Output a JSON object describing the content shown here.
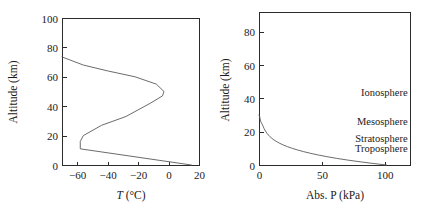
{
  "figure": {
    "background_color": "#ffffff",
    "axis_color": "#2b2b2b",
    "curve_color": "#5a5a5a",
    "text_color": "#1a1a1a"
  },
  "chart_data": [
    {
      "type": "line",
      "id": "temperature-profile",
      "title": "",
      "xlabel_prefix": "T",
      "xlabel_suffix": " (°C)",
      "xlabel": "T (°C)",
      "ylabel": "Altitude (km)",
      "xlim": [
        -70,
        20
      ],
      "ylim": [
        0,
        100
      ],
      "grid": false,
      "legend": "none",
      "xticks": [
        -60,
        -40,
        -20,
        0,
        20
      ],
      "xtick_labels": [
        "−60",
        "−40",
        "−20",
        "0",
        "20"
      ],
      "yticks": [
        0,
        20,
        40,
        60,
        80,
        100
      ],
      "ytick_labels": [
        "0",
        "20",
        "40",
        "60",
        "80",
        "100"
      ],
      "series": [
        {
          "name": "Standard atmosphere temperature",
          "x": [
            15,
            -58,
            -58,
            -56,
            -44,
            -28,
            -12,
            -4,
            -3,
            -8,
            -22,
            -40,
            -56,
            -70
          ],
          "y": [
            0,
            11,
            16,
            20,
            27,
            33,
            42,
            47,
            50,
            55,
            60,
            64,
            68,
            73.5
          ],
          "x_units": "°C",
          "y_units": "km"
        }
      ]
    },
    {
      "type": "line",
      "id": "pressure-profile",
      "title": "",
      "xlabel": "Abs. P (kPa)",
      "ylabel": "Altitude (km)",
      "xlim": [
        0,
        120
      ],
      "ylim": [
        0,
        92
      ],
      "grid": false,
      "legend": "none",
      "xticks": [
        0,
        50,
        100
      ],
      "xtick_labels": [
        "0",
        "50",
        "100"
      ],
      "yticks": [
        0,
        20,
        40,
        60,
        80
      ],
      "ytick_labels": [
        "0",
        "20",
        "40",
        "60",
        "80"
      ],
      "series": [
        {
          "name": "Standard atmosphere absolute pressure",
          "x": [
            101.3,
            89.9,
            79.5,
            70.1,
            61.6,
            54.0,
            47.2,
            41.1,
            35.6,
            30.8,
            26.5,
            22.7,
            19.4,
            16.6,
            14.2,
            12.0,
            10.3,
            8.8,
            7.5,
            6.4,
            5.5,
            4.7,
            4.0,
            3.4,
            2.9,
            2.1,
            1.5,
            1.1,
            0.8,
            0.6,
            0.4,
            0.3,
            0.2,
            0.1,
            0.0
          ],
          "y": [
            0,
            1,
            2,
            3,
            4,
            5,
            6,
            7,
            8,
            9,
            10,
            11,
            12,
            13,
            14,
            15,
            16,
            17,
            18,
            19,
            20,
            21,
            22,
            23,
            24,
            25,
            26,
            27,
            28,
            29,
            29.4,
            29.7,
            29.9,
            30,
            30
          ],
          "x_units": "kPa",
          "y_units": "km"
        }
      ],
      "annotations": [
        {
          "text": "Ionosphere",
          "x_frac": 0.985,
          "y_km": 44
        },
        {
          "text": "Mesosphere",
          "x_frac": 0.985,
          "y_km": 26.5
        },
        {
          "text": "Stratosphere",
          "x_frac": 0.985,
          "y_km": 16.5
        },
        {
          "text": "Troposphere",
          "x_frac": 0.985,
          "y_km": 10.5
        }
      ]
    }
  ]
}
